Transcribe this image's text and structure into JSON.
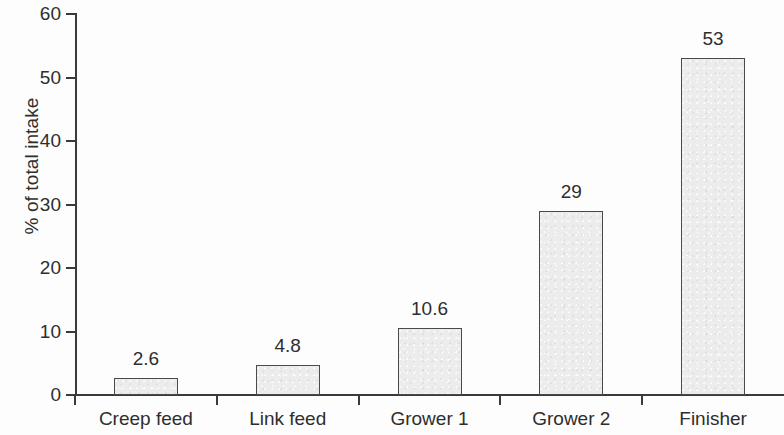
{
  "chart_data": {
    "type": "bar",
    "title": "",
    "subtitle": "",
    "xlabel": "",
    "ylabel": "% of total intake",
    "categories": [
      "Creep feed",
      "Link feed",
      "Grower 1",
      "Grower 2",
      "Finisher"
    ],
    "values": [
      2.6,
      4.8,
      10.6,
      29,
      53
    ],
    "value_labels": [
      "2.6",
      "4.8",
      "10.6",
      "29",
      "53"
    ],
    "ylim": [
      0,
      60
    ],
    "ytick_labels": [
      "0",
      "10",
      "20",
      "30",
      "40",
      "50",
      "60"
    ],
    "ytick_values": [
      0,
      10,
      20,
      30,
      40,
      50,
      60
    ],
    "grid": false,
    "legend": null,
    "bar_fill_color": "#ececec",
    "bar_border_color": "#4a4a4a",
    "axis_color": "#3a3a3a",
    "text_color": "#2e2e2e",
    "background_color": "#fdfdfd"
  }
}
